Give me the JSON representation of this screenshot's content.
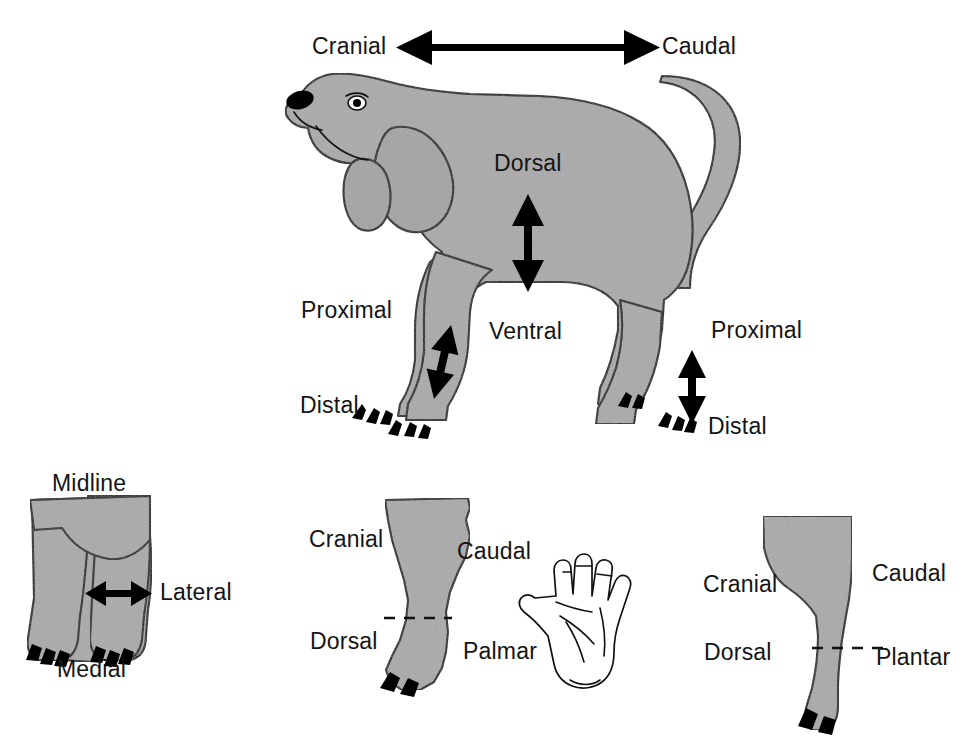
{
  "figure": {
    "colors": {
      "body_gray": "#a9a9a9",
      "outline_black": "#111111",
      "background": "#ffffff",
      "claw_black": "#000000"
    }
  },
  "top_axis": {
    "left_label": "Cranial",
    "right_label": "Caudal",
    "arrow": "double-headed-horizontal-arrow"
  },
  "dog_panel": {
    "name": "lateral-view-dog",
    "labels": {
      "dorsal": "Dorsal",
      "ventral": "Ventral",
      "proximal_front": "Proximal",
      "distal_front": "Distal",
      "proximal_hind": "Proximal",
      "distal_hind": "Distal"
    },
    "arrows": {
      "dorsoventral": "double-headed-vertical-arrow",
      "forelimb": "double-headed-diagonal-arrow",
      "hindlimb": "double-headed-vertical-arrow"
    }
  },
  "frontal_panel": {
    "name": "frontal-view-forelimbs",
    "labels": {
      "midline": "Midline",
      "medial": "Medial",
      "lateral": "Lateral"
    },
    "arrows": {
      "mediolateral": "double-headed-horizontal-arrow"
    }
  },
  "forelimb_panel": {
    "name": "forelimb-distal-view",
    "labels": {
      "cranial": "Cranial",
      "caudal": "Caudal",
      "dorsal": "Dorsal",
      "palmar": "Palmar"
    },
    "divider": "dashed-line",
    "inset": "human-hand-palm-icon"
  },
  "hindlimb_panel": {
    "name": "hindlimb-distal-view",
    "labels": {
      "cranial": "Cranial",
      "caudal": "Caudal",
      "dorsal": "Dorsal",
      "plantar": "Plantar"
    },
    "divider": "dashed-line"
  }
}
